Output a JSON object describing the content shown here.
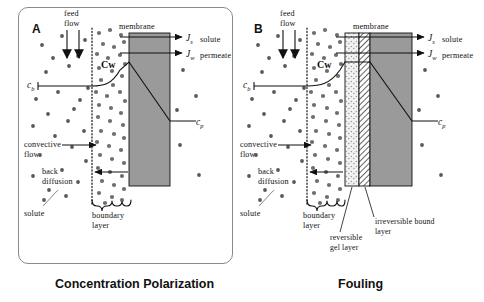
{
  "figure": {
    "type": "scientific-diagram"
  },
  "panels": [
    {
      "letter": "A",
      "caption": "Concentration Polarization",
      "labels": {
        "feed_flow": "feed\nflow",
        "feed_flow_line1": "feed",
        "feed_flow_line2": "flow",
        "membrane": "membrane",
        "convective_flow_line1": "convective",
        "convective_flow_line2": "flow",
        "back_diffusion_line1": "back",
        "back_diffusion_line2": "diffusion",
        "solute": "solute",
        "boundary_layer_line1": "boundary",
        "boundary_layer_line2": "layer"
      },
      "flux_arrows": [
        {
          "symbol": "J",
          "subscript": "s",
          "label": "solute"
        },
        {
          "symbol": "J",
          "subscript": "w",
          "label": "permeate"
        }
      ],
      "concentrations": [
        {
          "symbol": "c",
          "subscript": "b",
          "name": "bulk-concentration"
        },
        {
          "symbol": "c",
          "subscript": "w",
          "name": "wall-concentration",
          "display": "Cw"
        },
        {
          "symbol": "c",
          "subscript": "p",
          "name": "permeate-concentration"
        }
      ],
      "layers": [
        {
          "name": "membrane",
          "fill": "#9a9a9a"
        }
      ]
    },
    {
      "letter": "B",
      "caption": "Fouling",
      "labels": {
        "feed_flow_line1": "feed",
        "feed_flow_line2": "flow",
        "membrane": "membrane",
        "convective_flow_line1": "convective",
        "convective_flow_line2": "flow",
        "back_diffusion_line1": "back",
        "back_diffusion_line2": "diffusion",
        "solute": "solute",
        "boundary_layer_line1": "boundary",
        "boundary_layer_line2": "layer",
        "irreversible_bound_layer_line1": "irreversible bound",
        "irreversible_bound_layer_line2": "layer",
        "reversible_gel_layer_line1": "reversible",
        "reversible_gel_layer_line2": "gel layer"
      },
      "flux_arrows": [
        {
          "symbol": "J",
          "subscript": "s",
          "label": "solute"
        },
        {
          "symbol": "J",
          "subscript": "w",
          "label": "permeate"
        }
      ],
      "concentrations": [
        {
          "symbol": "c",
          "subscript": "b",
          "name": "bulk-concentration"
        },
        {
          "symbol": "c",
          "subscript": "w",
          "name": "wall-concentration",
          "display": "Cw"
        },
        {
          "symbol": "c",
          "subscript": "p",
          "name": "permeate-concentration"
        }
      ],
      "layers": [
        {
          "name": "reversible-gel-layer",
          "fill": "#f0f0f0"
        },
        {
          "name": "irreversible-bound-layer",
          "fill": "#ffffff"
        },
        {
          "name": "membrane",
          "fill": "#9a9a9a"
        }
      ]
    }
  ],
  "colors": {
    "membrane_gray": "#9a9a9a",
    "gel_layer": "#f0f0f0",
    "bound_layer": "#ffffff",
    "stroke": "#111111",
    "panel_border": "#8a8a8a",
    "particle": "#585858",
    "background": "#ffffff"
  }
}
